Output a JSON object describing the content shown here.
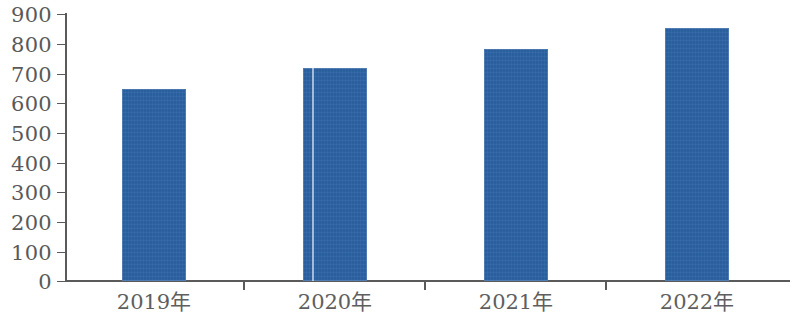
{
  "chart_data": {
    "type": "bar",
    "title": "",
    "subtitle": "",
    "xlabel": "",
    "ylabel": "",
    "categories": [
      "2019年",
      "2020年",
      "2021年",
      "2022年"
    ],
    "values": [
      650,
      720,
      785,
      855
    ],
    "series": [
      {
        "name": "",
        "values": [
          650,
          720,
          785,
          855
        ]
      }
    ],
    "ylim": [
      0,
      900
    ],
    "y_ticks": [
      0,
      100,
      200,
      300,
      400,
      500,
      600,
      700,
      800,
      900
    ],
    "y_tick_labels": [
      "0",
      "100",
      "200",
      "300",
      "400",
      "500",
      "600",
      "700",
      "800",
      "900"
    ],
    "grid": false,
    "legend": null,
    "legend_position": "none",
    "bar_color": "#2b63a5",
    "axis_color": "#5a5a5a",
    "tick_label_color": "#595959"
  },
  "axis": {
    "y_labels": [
      "900",
      "800",
      "700",
      "600",
      "500",
      "400",
      "300",
      "200",
      "100",
      "0"
    ],
    "x_labels": [
      "2019年",
      "2020年",
      "2021年",
      "2022年"
    ]
  }
}
